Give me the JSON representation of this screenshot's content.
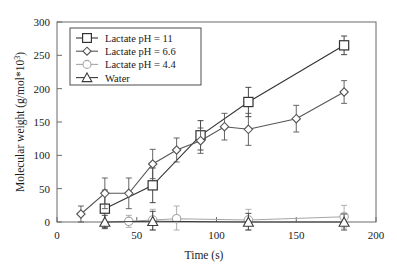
{
  "chart_data": {
    "type": "line",
    "title": "",
    "xlabel": "Time (s)",
    "ylabel": "Molecular weight (g/mol*10³)",
    "xlim": [
      0,
      200
    ],
    "ylim": [
      0,
      300
    ],
    "xticks": [
      0,
      50,
      100,
      150,
      200
    ],
    "yticks": [
      0,
      50,
      100,
      150,
      200,
      250,
      300
    ],
    "grid": false,
    "legend_position": "upper-left",
    "error_bars": true,
    "series": [
      {
        "name": "Lactate pH = 11",
        "marker": "square",
        "color": "#333333",
        "x": [
          30,
          60,
          90,
          120,
          180
        ],
        "values": [
          20,
          55,
          130,
          180,
          265
        ],
        "yerr": [
          28,
          26,
          22,
          22,
          14
        ]
      },
      {
        "name": "Lactate pH = 6.6",
        "marker": "diamond",
        "color": "#555555",
        "x": [
          15,
          30,
          45,
          60,
          75,
          90,
          105,
          120,
          150,
          180
        ],
        "values": [
          12,
          43,
          43,
          87,
          108,
          122,
          143,
          139,
          155,
          195
        ],
        "yerr": [
          12,
          23,
          23,
          22,
          18,
          19,
          20,
          24,
          20,
          17
        ]
      },
      {
        "name": "Lactate pH = 4.4",
        "marker": "circle",
        "color": "#a6a6a6",
        "x": [
          45,
          60,
          75,
          120,
          180
        ],
        "values": [
          1,
          3,
          5,
          3,
          8
        ],
        "yerr": [
          9,
          16,
          19,
          16,
          17
        ]
      },
      {
        "name": "Water",
        "marker": "triangle",
        "color": "#3b3b3b",
        "x": [
          30,
          60,
          120,
          180
        ],
        "values": [
          0,
          1,
          0,
          0
        ],
        "yerr": [
          10,
          15,
          13,
          12
        ]
      }
    ]
  },
  "legend": {
    "entries": [
      {
        "label": "Lactate pH = 11"
      },
      {
        "label": "Lactate pH = 6.6"
      },
      {
        "label": "Lactate pH = 4.4"
      },
      {
        "label": "Water"
      }
    ]
  },
  "axes": {
    "y_tick_labels": [
      "0",
      "50",
      "100",
      "150",
      "200",
      "250",
      "300"
    ],
    "x_tick_labels": [
      "0",
      "50",
      "100",
      "150",
      "200"
    ],
    "x_title": "Time (s)",
    "y_title_main": "Molecular weight (g/mol*10",
    "y_title_sup": "3",
    "y_title_close": ")"
  }
}
